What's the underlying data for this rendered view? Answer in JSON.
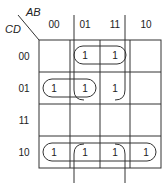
{
  "kmap": {
    "row_var": "CD",
    "col_var": "AB",
    "col_labels": [
      "00",
      "01",
      "11",
      "10"
    ],
    "row_labels": [
      "00",
      "01",
      "11",
      "10"
    ],
    "cells": [
      [
        "",
        "1",
        "1",
        ""
      ],
      [
        "1",
        "1",
        "1",
        ""
      ],
      [
        "",
        "",
        "",
        ""
      ],
      [
        "1",
        "1",
        "1",
        "1"
      ]
    ],
    "groups": [
      {
        "name": "row00-cols01-11",
        "cells": [
          [
            0,
            1
          ],
          [
            0,
            2
          ]
        ]
      },
      {
        "name": "row01-cols00-01",
        "cells": [
          [
            1,
            0
          ],
          [
            1,
            1
          ]
        ]
      },
      {
        "name": "row10-all",
        "cells": [
          [
            3,
            0
          ],
          [
            3,
            1
          ],
          [
            3,
            2
          ],
          [
            3,
            3
          ]
        ]
      },
      {
        "name": "cols01-11-wrap",
        "cells": [
          [
            0,
            1
          ],
          [
            0,
            2
          ],
          [
            1,
            1
          ],
          [
            1,
            2
          ],
          [
            3,
            1
          ],
          [
            3,
            2
          ]
        ]
      }
    ],
    "line_color": "#333333"
  }
}
